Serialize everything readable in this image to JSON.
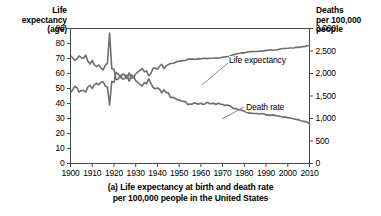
{
  "figure": {
    "caption_line1": "(a) Life expectancy at birth and death rate",
    "caption_line2": "per 100,000 people in the United States"
  },
  "left_axis": {
    "header_line1": "Life",
    "header_line2": "expectancy",
    "header_line3": "(age)",
    "ticks": [
      "90",
      "80",
      "70",
      "60",
      "50",
      "40",
      "30",
      "20",
      "10",
      "0"
    ]
  },
  "right_axis": {
    "header_line1": "Deaths",
    "header_line2": "per 100,000",
    "header_line3": "people",
    "ticks": [
      "3,000",
      "2,500",
      "2,000",
      "1,500",
      "1,000",
      "500",
      "0"
    ]
  },
  "x_axis": {
    "ticks": [
      "1900",
      "1910",
      "1920",
      "1930",
      "1940",
      "1950",
      "1960",
      "1970",
      "1980",
      "1990",
      "2000",
      "2010"
    ]
  },
  "annotations": {
    "life_expectancy": "Life expectancy",
    "death_rate": "Death rate"
  },
  "colors": {
    "series": "#6e6e6e",
    "axis": "#4a4a4a",
    "text": "#000000",
    "background": "#ffffff"
  },
  "chart_data": {
    "type": "line",
    "title": "(a) Life expectancy at birth and death rate per 100,000 people in the United States",
    "xlabel": "",
    "ylabel": "Life expectancy (age)",
    "y2label": "Deaths per 100,000 people",
    "xlim": [
      1900,
      2010
    ],
    "ylim": [
      0,
      90
    ],
    "y2lim": [
      0,
      3000
    ],
    "grid": false,
    "legend": "annotation-labels-on-curves",
    "x": [
      1900,
      1901,
      1902,
      1903,
      1904,
      1905,
      1906,
      1907,
      1908,
      1909,
      1910,
      1911,
      1912,
      1913,
      1914,
      1915,
      1916,
      1917,
      1918,
      1919,
      1920,
      1921,
      1922,
      1923,
      1924,
      1925,
      1926,
      1927,
      1928,
      1929,
      1930,
      1931,
      1932,
      1933,
      1934,
      1935,
      1936,
      1937,
      1938,
      1939,
      1940,
      1941,
      1942,
      1943,
      1944,
      1945,
      1946,
      1947,
      1948,
      1949,
      1950,
      1951,
      1952,
      1953,
      1954,
      1955,
      1956,
      1957,
      1958,
      1959,
      1960,
      1961,
      1962,
      1963,
      1964,
      1965,
      1966,
      1967,
      1968,
      1969,
      1970,
      1971,
      1972,
      1973,
      1974,
      1975,
      1976,
      1977,
      1978,
      1979,
      1980,
      1981,
      1982,
      1983,
      1984,
      1985,
      1986,
      1987,
      1988,
      1989,
      1990,
      1991,
      1992,
      1993,
      1994,
      1995,
      1996,
      1997,
      1998,
      1999,
      2000,
      2001,
      2002,
      2003,
      2004,
      2005,
      2006,
      2007,
      2008,
      2009,
      2010
    ],
    "series": [
      {
        "name": "Life expectancy",
        "axis": "left",
        "units": "years",
        "values": [
          47.3,
          49.1,
          51.5,
          50.5,
          47.6,
          48.7,
          48.7,
          47.6,
          51.1,
          52.1,
          50.0,
          52.6,
          53.5,
          52.5,
          54.2,
          54.5,
          51.7,
          50.9,
          39.1,
          54.7,
          54.1,
          60.8,
          59.6,
          57.2,
          59.7,
          59.0,
          56.7,
          60.4,
          56.8,
          57.1,
          59.7,
          61.1,
          62.1,
          63.3,
          61.1,
          61.7,
          58.5,
          60.0,
          63.5,
          63.7,
          62.9,
          64.8,
          66.2,
          63.3,
          65.2,
          65.9,
          66.7,
          66.8,
          67.2,
          68.0,
          68.2,
          68.4,
          68.6,
          68.8,
          69.6,
          69.6,
          69.7,
          69.5,
          69.6,
          69.9,
          69.7,
          70.2,
          70.1,
          69.9,
          70.2,
          70.2,
          70.2,
          70.5,
          70.2,
          70.5,
          70.8,
          71.1,
          71.2,
          71.4,
          72.0,
          72.6,
          72.9,
          73.3,
          73.5,
          73.9,
          73.7,
          74.1,
          74.5,
          74.6,
          74.7,
          74.7,
          74.7,
          74.9,
          74.9,
          75.1,
          75.4,
          75.5,
          75.8,
          75.5,
          75.7,
          75.8,
          76.1,
          76.5,
          76.7,
          76.7,
          76.8,
          77.0,
          77.0,
          77.1,
          77.5,
          77.4,
          77.7,
          77.9,
          78.1,
          78.5,
          78.7
        ]
      },
      {
        "name": "Death rate",
        "axis": "right",
        "units": "deaths per 100,000 people",
        "values": [
          2400,
          2350,
          2290,
          2330,
          2390,
          2350,
          2340,
          2410,
          2270,
          2210,
          2290,
          2190,
          2150,
          2190,
          2120,
          2080,
          2180,
          2230,
          2900,
          2100,
          2100,
          1860,
          1880,
          1960,
          1870,
          1890,
          1960,
          1830,
          1970,
          1930,
          1840,
          1800,
          1760,
          1720,
          1800,
          1770,
          1880,
          1780,
          1690,
          1660,
          1680,
          1650,
          1570,
          1640,
          1580,
          1570,
          1470,
          1470,
          1450,
          1420,
          1410,
          1390,
          1380,
          1370,
          1310,
          1320,
          1320,
          1350,
          1330,
          1320,
          1340,
          1310,
          1330,
          1360,
          1330,
          1330,
          1340,
          1310,
          1340,
          1320,
          1310,
          1290,
          1300,
          1290,
          1260,
          1220,
          1220,
          1200,
          1190,
          1180,
          1160,
          1140,
          1120,
          1120,
          1110,
          1110,
          1110,
          1100,
          1110,
          1100,
          1080,
          1080,
          1070,
          1080,
          1070,
          1060,
          1050,
          1040,
          1030,
          1030,
          1020,
          1010,
          1000,
          990,
          980,
          970,
          950,
          940,
          930,
          920,
          880
        ]
      }
    ],
    "notable_events": [
      {
        "year": 1918,
        "note": "Influenza pandemic: life expectancy drops to 39.1; death rate spikes to ~2,900"
      },
      {
        "year": 1940,
        "note": "Curves cross as life expectancy rises above scaled death rate"
      }
    ]
  }
}
